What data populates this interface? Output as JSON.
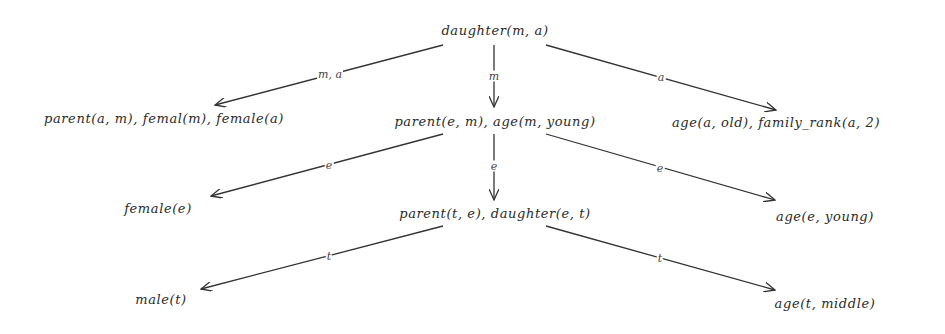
{
  "diagram": {
    "type": "tree",
    "nodes": {
      "root": {
        "label": "daughter(m, a)"
      },
      "l1_left": {
        "label": "parent(a, m), femal(m), female(a)"
      },
      "l1_mid": {
        "label": "parent(e, m), age(m, young)"
      },
      "l1_right": {
        "label": "age(a, old), family_rank(a, 2)"
      },
      "l2_left": {
        "label": "female(e)"
      },
      "l2_mid": {
        "label": "parent(t, e), daughter(e, t)"
      },
      "l2_right": {
        "label": "age(e, young)"
      },
      "l3_left": {
        "label": "male(t)"
      },
      "l3_right": {
        "label": "age(t, middle)"
      }
    },
    "edges": [
      {
        "from": "root",
        "to": "l1_left",
        "label": "m, a"
      },
      {
        "from": "root",
        "to": "l1_mid",
        "label": "m"
      },
      {
        "from": "root",
        "to": "l1_right",
        "label": "a"
      },
      {
        "from": "l1_mid",
        "to": "l2_left",
        "label": "e"
      },
      {
        "from": "l1_mid",
        "to": "l2_mid",
        "label": "e"
      },
      {
        "from": "l1_mid",
        "to": "l2_right",
        "label": "e"
      },
      {
        "from": "l2_mid",
        "to": "l3_left",
        "label": "t"
      },
      {
        "from": "l2_mid",
        "to": "l3_right",
        "label": "t"
      }
    ],
    "colors": {
      "line": "#333333",
      "text": "#2a2a2a",
      "background": "#ffffff"
    }
  }
}
